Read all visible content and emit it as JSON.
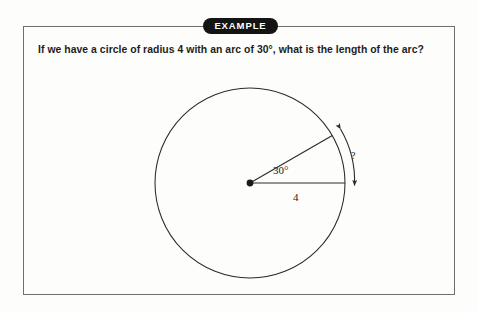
{
  "page": {
    "background_color": "#fdfdfc"
  },
  "example_box": {
    "border_color": "#6f6f6f"
  },
  "badge": {
    "label": "EXAMPLE",
    "background_color": "#141414",
    "text_color": "#ffffff"
  },
  "question": {
    "text": "If we have a circle of radius 4 with an arc of 30°, what is the length of the arc?"
  },
  "figure": {
    "name": "circle-arc-length-diagram",
    "stroke_color": "#2a2a2a",
    "center_label": "",
    "angle_label": "30°",
    "radius_label": "4",
    "arc_label": "?",
    "radius_value": 4,
    "arc_angle_degrees": 30,
    "circle": {
      "center_x": 110,
      "center_y": 105,
      "radius": 95
    },
    "radii": [
      {
        "name": "horizontal-radius",
        "angle_degrees": 0,
        "label": "4"
      },
      {
        "name": "upper-radius",
        "angle_degrees": 30,
        "label": ""
      }
    ],
    "arc_measure_arrow": {
      "name": "arc-length-double-arrow",
      "both_ends_arrowheads": true,
      "label": "?"
    }
  }
}
